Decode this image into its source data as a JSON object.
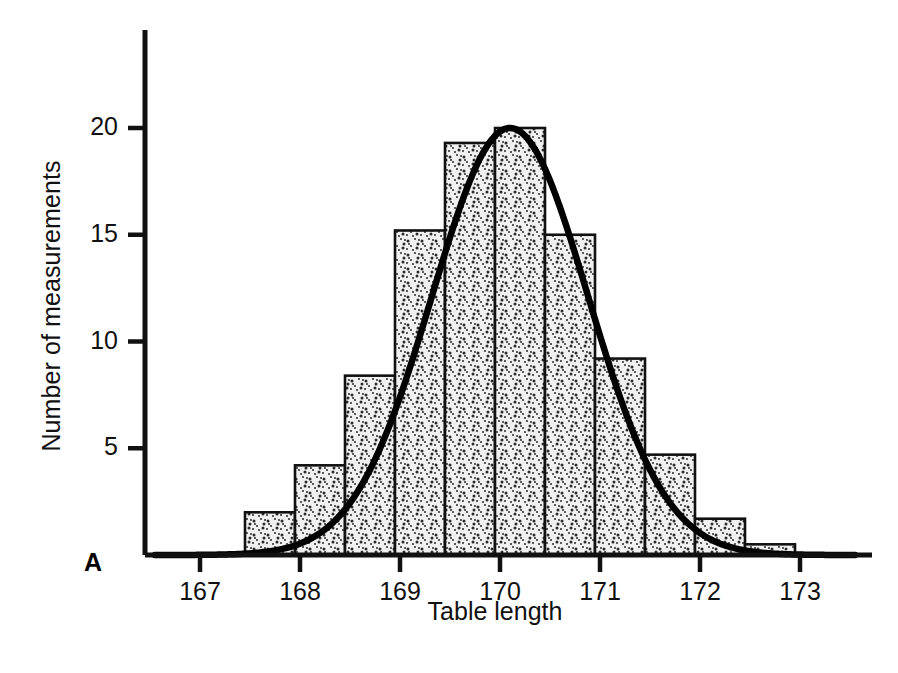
{
  "figure": {
    "panel_letter": "A",
    "background_color": "#ffffff",
    "ink_color": "#111111",
    "bar_fill_color": "#f0f0f0",
    "curve_color": "#000000"
  },
  "chart_data": {
    "type": "bar",
    "title": "",
    "subtitle": "",
    "xlabel": "Table length",
    "ylabel": "Number of measurements",
    "panel_label": "A",
    "grid": false,
    "legend": null,
    "xlim": [
      166.55,
      173.55
    ],
    "ylim": [
      0,
      23
    ],
    "xticks": [
      167,
      168,
      169,
      170,
      171,
      172,
      173
    ],
    "xtick_labels": [
      "167",
      "168",
      "169",
      "170",
      "171",
      "172",
      "173"
    ],
    "yticks": [
      5,
      10,
      15,
      20
    ],
    "ytick_labels": [
      "5",
      "10",
      "15",
      "20"
    ],
    "bin_width": 0.5,
    "bin_edges": [
      167.45,
      167.95,
      168.45,
      168.95,
      169.45,
      169.95,
      170.45,
      170.95,
      171.45,
      171.95,
      172.45,
      172.95
    ],
    "bin_centers": [
      167.7,
      168.2,
      168.7,
      169.2,
      169.7,
      170.2,
      170.7,
      171.2,
      171.7,
      172.2,
      172.7
    ],
    "values": [
      2.0,
      4.2,
      8.4,
      15.2,
      19.3,
      20.0,
      15.0,
      9.2,
      4.7,
      1.7,
      0.5
    ],
    "overlay_curve": {
      "name": "normal-distribution-fit",
      "type": "line",
      "mean": 170.1,
      "sigma": 0.78,
      "peak": 20.0
    }
  }
}
